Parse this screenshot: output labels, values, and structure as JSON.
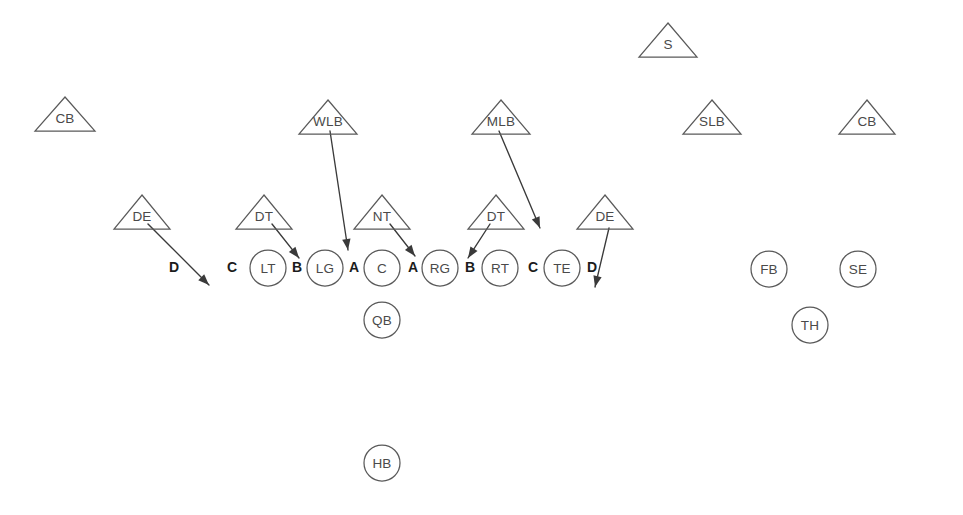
{
  "diagram": {
    "type": "football-play-diagram",
    "background_color": "#ffffff",
    "shape_stroke_color": "#5a5a5a",
    "label_color": "#4a4a4a",
    "gap_label_color": "#1c1c1c",
    "arrow_color": "#3a3a3a"
  },
  "defense": {
    "shape": "triangle",
    "players": [
      {
        "label": "CB",
        "cx": 65,
        "cy": 114,
        "half_width": 30,
        "height": 34
      },
      {
        "label": "S",
        "cx": 668,
        "cy": 40,
        "half_width": 29,
        "height": 34
      },
      {
        "label": "SLB",
        "cx": 712,
        "cy": 117,
        "half_width": 29,
        "height": 34
      },
      {
        "label": "CB",
        "cx": 867,
        "cy": 117,
        "half_width": 28,
        "height": 34
      },
      {
        "label": "WLB",
        "cx": 328,
        "cy": 117,
        "half_width": 29,
        "height": 34
      },
      {
        "label": "MLB",
        "cx": 501,
        "cy": 117,
        "half_width": 29,
        "height": 34
      },
      {
        "label": "DE",
        "cx": 142,
        "cy": 212,
        "half_width": 28,
        "height": 34
      },
      {
        "label": "DT",
        "cx": 264,
        "cy": 212,
        "half_width": 28,
        "height": 34
      },
      {
        "label": "NT",
        "cx": 382,
        "cy": 212,
        "half_width": 28,
        "height": 34
      },
      {
        "label": "DT",
        "cx": 496,
        "cy": 212,
        "half_width": 28,
        "height": 34
      },
      {
        "label": "DE",
        "cx": 605,
        "cy": 212,
        "half_width": 28,
        "height": 34
      }
    ]
  },
  "offense": {
    "shape": "circle",
    "radius": 18,
    "players": [
      {
        "label": "LT",
        "cx": 268,
        "cy": 268
      },
      {
        "label": "LG",
        "cx": 325,
        "cy": 268
      },
      {
        "label": "C",
        "cx": 382,
        "cy": 268
      },
      {
        "label": "RG",
        "cx": 440,
        "cy": 268
      },
      {
        "label": "RT",
        "cx": 500,
        "cy": 268
      },
      {
        "label": "TE",
        "cx": 562,
        "cy": 268
      },
      {
        "label": "QB",
        "cx": 382,
        "cy": 320
      },
      {
        "label": "HB",
        "cx": 382,
        "cy": 463
      },
      {
        "label": "FB",
        "cx": 769,
        "cy": 269
      },
      {
        "label": "SE",
        "cx": 858,
        "cy": 269
      },
      {
        "label": "TH",
        "cx": 810,
        "cy": 325
      }
    ]
  },
  "gaps": [
    {
      "label": "D",
      "x": 174,
      "y": 267
    },
    {
      "label": "C",
      "x": 232,
      "y": 267
    },
    {
      "label": "B",
      "x": 297,
      "y": 267
    },
    {
      "label": "A",
      "x": 354,
      "y": 267
    },
    {
      "label": "A",
      "x": 413,
      "y": 267
    },
    {
      "label": "B",
      "x": 470,
      "y": 267
    },
    {
      "label": "C",
      "x": 533,
      "y": 267
    },
    {
      "label": "D",
      "x": 592,
      "y": 267
    }
  ],
  "assignments": [
    {
      "from": "DE",
      "to": "D",
      "x1": 148,
      "y1": 224,
      "x2": 209,
      "y2": 285
    },
    {
      "from": "DT",
      "to": "B",
      "x1": 272,
      "y1": 224,
      "x2": 299,
      "y2": 258
    },
    {
      "from": "WLB",
      "to": "A",
      "x1": 330,
      "y1": 131,
      "x2": 348,
      "y2": 250
    },
    {
      "from": "NT",
      "to": "A",
      "x1": 390,
      "y1": 224,
      "x2": 415,
      "y2": 256
    },
    {
      "from": "DT",
      "to": "B",
      "x1": 490,
      "y1": 224,
      "x2": 468,
      "y2": 258
    },
    {
      "from": "MLB",
      "to": "C",
      "x1": 499,
      "y1": 131,
      "x2": 540,
      "y2": 228
    },
    {
      "from": "DE",
      "to": "D",
      "x1": 609,
      "y1": 228,
      "x2": 595,
      "y2": 287
    }
  ],
  "chart_data": {
    "type": "diagram",
    "defense_units": [
      "CB",
      "S",
      "SLB",
      "CB",
      "WLB",
      "MLB",
      "DE",
      "DT",
      "NT",
      "DT",
      "DE"
    ],
    "offense_units": [
      "LT",
      "LG",
      "C",
      "RG",
      "RT",
      "TE",
      "QB",
      "HB",
      "FB",
      "SE",
      "TH"
    ],
    "gap_sequence": [
      "D",
      "C",
      "B",
      "A",
      "A",
      "B",
      "C",
      "D"
    ],
    "assignment_pairs": [
      "DE -> D (left)",
      "DT -> B (left)",
      "WLB -> A (left)",
      "NT -> A (right)",
      "DT -> B (right)",
      "MLB -> C (right)",
      "DE -> D (right)"
    ]
  }
}
